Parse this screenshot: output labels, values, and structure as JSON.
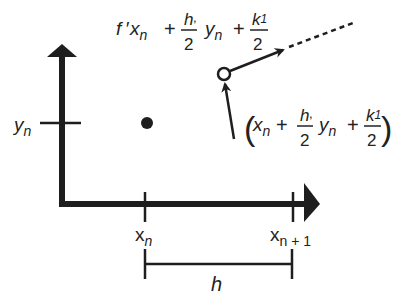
{
  "diagram": {
    "colors": {
      "ink": "#1e1e1e",
      "background": "#ffffff"
    },
    "axes": {
      "y_tick_label_base": "y",
      "y_tick_label_sub": "n"
    },
    "x_ticks": [
      {
        "base": "x",
        "sub": "n"
      },
      {
        "base": "x",
        "sub": "n + 1"
      }
    ],
    "step_label": "h",
    "slope_label": {
      "prefix": "f ′",
      "x_base": "x",
      "x_sub": "n",
      "plus1": "+",
      "h_num": "h",
      "h_den": "2",
      "comma": ",",
      "y_base": "y",
      "y_sub": "n",
      "plus2": "+",
      "k_num": "k",
      "k_sub": "1",
      "k_den": "2"
    },
    "midpoint_label": {
      "open_paren": "(",
      "close_paren": ")",
      "x_base": "x",
      "x_sub": "n",
      "plus1": "+",
      "h_num": "h",
      "h_den": "2",
      "comma": ",",
      "y_base": "y",
      "y_sub": "n",
      "plus2": "+",
      "k_num": "k",
      "k_sub": "1",
      "k_den": "2"
    },
    "points": [
      {
        "name": "current-point",
        "type": "filled"
      },
      {
        "name": "midpoint",
        "type": "open"
      }
    ]
  }
}
